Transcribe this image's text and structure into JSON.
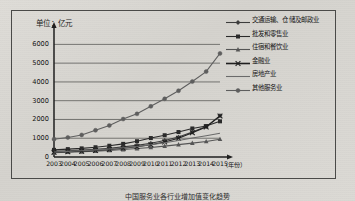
{
  "figure": {
    "unit_label": "单位：亿元",
    "caption": "中国服务业各行业增加值变化趋势"
  },
  "chart_data": {
    "type": "line",
    "title": "",
    "xlabel": "（年份）",
    "ylabel": "单位：亿元",
    "ylim": [
      0,
      6500
    ],
    "yticks": [
      0,
      1000,
      2000,
      3000,
      4000,
      5000,
      6000
    ],
    "grid": true,
    "legend_position": "right",
    "categories": [
      "2003",
      "2004",
      "2005",
      "2006",
      "2007",
      "2008",
      "2009",
      "2010",
      "2011",
      "2012",
      "2013",
      "2014",
      "2015"
    ],
    "series": [
      {
        "name": "交通运输、仓储及邮政业",
        "marker": "diamond",
        "color": "#3c3c3c",
        "values": [
          300,
          330,
          365,
          410,
          470,
          540,
          620,
          730,
          880,
          1060,
          1330,
          1620,
          2200
        ]
      },
      {
        "name": "批发和零售业",
        "marker": "square",
        "color": "#2a2a2a",
        "values": [
          380,
          420,
          460,
          520,
          600,
          700,
          840,
          1010,
          1160,
          1330,
          1520,
          1650,
          1900
        ]
      },
      {
        "name": "住宿和餐饮业",
        "marker": "triangle",
        "color": "#555555",
        "values": [
          230,
          255,
          280,
          310,
          350,
          400,
          450,
          510,
          580,
          660,
          740,
          830,
          950
        ]
      },
      {
        "name": "金融业",
        "marker": "cross-line",
        "color": "#1f1f1f",
        "values": [
          250,
          280,
          310,
          350,
          400,
          465,
          545,
          650,
          800,
          1000,
          1290,
          1600,
          2180
        ]
      },
      {
        "name": "房地产业",
        "marker": "none",
        "color": "#6a6a6a",
        "values": [
          270,
          300,
          335,
          380,
          430,
          490,
          560,
          650,
          760,
          880,
          1010,
          1130,
          1260
        ]
      },
      {
        "name": "其他服务业",
        "marker": "circle",
        "color": "#5e5e5e",
        "values": [
          950,
          1040,
          1175,
          1425,
          1680,
          2020,
          2300,
          2700,
          3100,
          3530,
          4020,
          4550,
          5520
        ]
      }
    ]
  }
}
